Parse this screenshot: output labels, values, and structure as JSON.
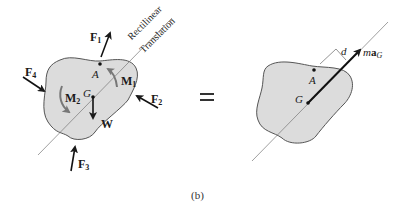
{
  "figure": {
    "caption": "(b)",
    "equals_sign": "=",
    "fill_color": "#dcdcdc",
    "stroke_color": "#555555",
    "arrow_color": "#1a1a1a"
  },
  "left_diagram": {
    "title": "Free-body diagram",
    "line_label_1": "Rectilinear",
    "line_label_2": "Translation",
    "forces": [
      {
        "name": "F",
        "sub": "1"
      },
      {
        "name": "F",
        "sub": "2"
      },
      {
        "name": "F",
        "sub": "3"
      },
      {
        "name": "F",
        "sub": "4"
      }
    ],
    "moments": [
      {
        "name": "M",
        "sub": "1"
      },
      {
        "name": "M",
        "sub": "2"
      }
    ],
    "weight": "W",
    "points": {
      "A": "A",
      "G": "G"
    }
  },
  "right_diagram": {
    "title": "Kinetic diagram",
    "distance_label": "d",
    "inertia_vector": {
      "prefix": "m",
      "bold": "a",
      "sub": "G"
    },
    "points": {
      "A": "A",
      "G": "G"
    }
  }
}
